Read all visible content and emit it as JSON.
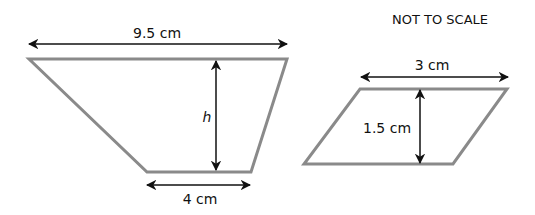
{
  "note": "NOT TO SCALE",
  "trapezoid": {
    "top_label": "9.5 cm",
    "height_label": "h",
    "bottom_label": "4 cm"
  },
  "parallelogram": {
    "top_label": "3 cm",
    "height_label": "1.5 cm"
  },
  "colors": {
    "shape_outline": "#8a8a8a",
    "arrow": "#111111"
  }
}
